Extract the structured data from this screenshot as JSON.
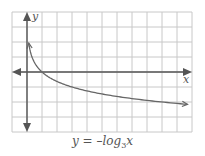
{
  "chart_data": {
    "type": "line",
    "caption": {
      "prefix": "y = –log",
      "base": "3",
      "var": "x"
    },
    "xlabel": "x",
    "ylabel": "y",
    "xlim": [
      -1,
      11
    ],
    "ylim": [
      -4,
      4
    ],
    "grid": true,
    "grid_step": 1,
    "series": [
      {
        "name": "y = -log3 x",
        "x": [
          0.12,
          0.2,
          0.333,
          0.5,
          1,
          2,
          3,
          5,
          7,
          9,
          10.7
        ],
        "y": [
          1.93,
          1.46,
          1.0,
          0.63,
          0,
          -0.63,
          -1,
          -1.46,
          -1.77,
          -2,
          -2.16
        ],
        "end_arrows": true
      }
    ]
  },
  "axes": {
    "x_label": "x",
    "y_label": "y"
  },
  "colors": {
    "grid": "#c8c8c8",
    "axis": "#555555",
    "curve": "#666666"
  }
}
